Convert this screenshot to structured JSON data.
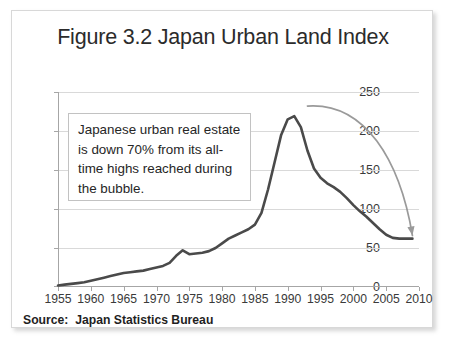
{
  "figure": {
    "title": "Figure 3.2 Japan Urban Land Index",
    "source_note": "Source:  Japan Statistics Bureau",
    "annotation": "Japanese urban real estate is down 70% from its all-time highs reached during the bubble."
  },
  "chart_data": {
    "type": "line",
    "title": "Figure 3.2 Japan Urban Land Index",
    "xlabel": "",
    "ylabel": "",
    "xlim": [
      1955,
      2010
    ],
    "ylim": [
      0,
      250
    ],
    "ytick_values": [
      0,
      50,
      100,
      150,
      200,
      250
    ],
    "ytick_labels": [
      "0",
      "50",
      "100",
      "150",
      "200",
      "250"
    ],
    "xtick_values": [
      1955,
      1960,
      1965,
      1970,
      1975,
      1980,
      1985,
      1990,
      1995,
      2000,
      2005,
      2010
    ],
    "xtick_labels": [
      "1955",
      "1960",
      "1965",
      "1970",
      "1975",
      "1980",
      "1985",
      "1990",
      "1995",
      "2000",
      "2005",
      "2010"
    ],
    "grid": "horizontal",
    "legend": "none",
    "line_color": "#4a4a4a",
    "arrow_color": "#9a9a9a",
    "series": [
      {
        "name": "Japan Urban Land Index",
        "x": [
          1955,
          1956,
          1957,
          1958,
          1959,
          1960,
          1961,
          1962,
          1963,
          1964,
          1965,
          1966,
          1967,
          1968,
          1969,
          1970,
          1971,
          1972,
          1973,
          1974,
          1975,
          1976,
          1977,
          1978,
          1979,
          1980,
          1981,
          1982,
          1983,
          1984,
          1985,
          1986,
          1987,
          1988,
          1989,
          1990,
          1991,
          1992,
          1993,
          1994,
          1995,
          1996,
          1997,
          1998,
          1999,
          2000,
          2001,
          2002,
          2003,
          2004,
          2005,
          2006,
          2007,
          2008,
          2009
        ],
        "values": [
          2,
          3,
          4,
          5,
          6,
          8,
          10,
          12,
          14,
          16,
          18,
          19,
          20,
          21,
          23,
          25,
          27,
          31,
          40,
          47,
          42,
          43,
          44,
          46,
          50,
          56,
          62,
          66,
          70,
          74,
          80,
          95,
          125,
          160,
          195,
          215,
          219,
          205,
          175,
          152,
          140,
          133,
          128,
          122,
          114,
          105,
          97,
          90,
          82,
          74,
          67,
          63,
          62,
          62,
          62
        ]
      }
    ],
    "annotations": [
      {
        "text": "Japanese urban real estate is down 70% from its all-time highs reached during the bubble.",
        "type": "textbox"
      },
      {
        "type": "arrow",
        "from": {
          "x": 1993,
          "y": 232
        },
        "to": {
          "x": 2009,
          "y": 66
        },
        "note": "curved arrow from peak area pointing to the 2009 end of the series"
      }
    ]
  }
}
